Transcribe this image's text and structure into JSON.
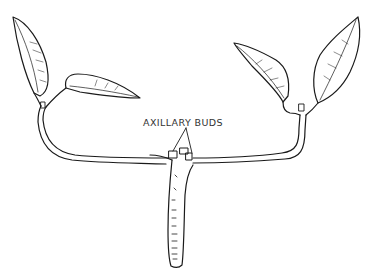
{
  "diagram": {
    "labels": {
      "axillary_buds": "AXILLARY BUDS"
    },
    "colors": {
      "ink": "#1a1a1a",
      "label": "#333333",
      "background": "#ffffff"
    },
    "parts": [
      "main-stem",
      "left-branch",
      "right-branch",
      "left-upright-leaf",
      "left-spreading-leaf",
      "right-spreading-leaf",
      "right-upright-leaf",
      "axillary-buds"
    ]
  }
}
